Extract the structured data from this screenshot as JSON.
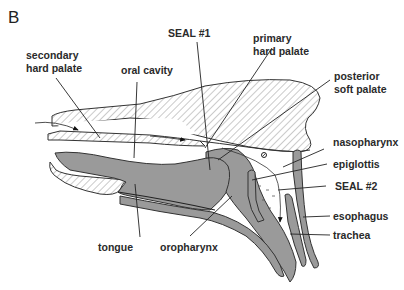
{
  "figure": {
    "panel_letter": "B",
    "colors": {
      "tissue_gray": "#9a9a9a",
      "hatch_line": "#8a8a8a",
      "outline": "#333333",
      "label_text": "#2a2a2a",
      "background": "#ffffff"
    },
    "labels": {
      "secondary_hard_palate": [
        "secondary",
        "hard palate"
      ],
      "oral_cavity": "oral cavity",
      "seal_1": "SEAL #1",
      "primary_hard_palate": [
        "primary",
        "hard palate"
      ],
      "posterior_soft_palate": [
        "posterior",
        "soft palate"
      ],
      "nasopharynx": "nasopharynx",
      "epiglottis": "epiglottis",
      "seal_2": "SEAL #2",
      "esophagus": "esophagus",
      "trachea": "trachea",
      "tongue": "tongue",
      "oropharynx": "oropharynx"
    }
  }
}
